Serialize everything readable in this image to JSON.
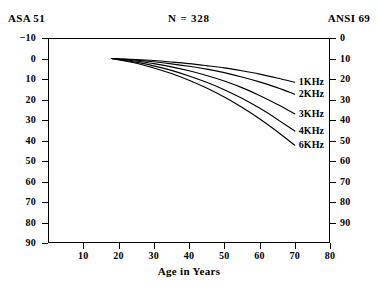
{
  "header": {
    "left_scale_label": "ASA 51",
    "right_scale_label": "ANSI 69",
    "sample_size": "N = 328"
  },
  "axes": {
    "x_title": "Age in Years",
    "x_ticks": [
      "10",
      "20",
      "30",
      "40",
      "50",
      "60",
      "70",
      "80"
    ],
    "y_left_ticks": [
      "-10",
      "0",
      "10",
      "20",
      "30",
      "40",
      "50",
      "60",
      "70",
      "80",
      "90"
    ],
    "y_right_ticks": [
      "0",
      "10",
      "20",
      "30",
      "40",
      "50",
      "60",
      "70",
      "80",
      "90"
    ]
  },
  "series_labels": {
    "s1": "1KHz",
    "s2": "2KHz",
    "s3": "3KHz",
    "s4": "4KHz",
    "s6": "6KHz"
  },
  "chart_data": {
    "type": "line",
    "title": "N = 328",
    "xlabel": "Age in Years",
    "ylabel": "Hearing Threshold Level (dB)",
    "y_left_axis_label": "ASA 51",
    "y_right_axis_label": "ANSI 69",
    "xlim": [
      0,
      80
    ],
    "ylim": [
      -10,
      90
    ],
    "y_inverted": true,
    "y_right_lim": [
      0,
      90
    ],
    "y_right_offset_db": 10,
    "grid": false,
    "legend": "inline-right-end-labels",
    "x": [
      18,
      25,
      30,
      35,
      40,
      45,
      50,
      55,
      60,
      65,
      70
    ],
    "series": [
      {
        "name": "1KHz",
        "values": [
          0,
          0.5,
          1.0,
          1.7,
          2.5,
          3.5,
          4.6,
          6.0,
          7.6,
          9.5,
          11.6
        ]
      },
      {
        "name": "2KHz",
        "values": [
          0,
          0.8,
          1.6,
          2.6,
          3.8,
          5.2,
          6.9,
          9.0,
          11.4,
          14.2,
          17.4
        ]
      },
      {
        "name": "3KHz",
        "values": [
          0,
          1.2,
          2.5,
          4.1,
          6.0,
          8.3,
          11.0,
          14.2,
          18.0,
          22.3,
          27.0
        ]
      },
      {
        "name": "4KHz",
        "values": [
          0,
          1.8,
          3.6,
          5.8,
          8.5,
          11.6,
          15.2,
          19.4,
          24.2,
          29.6,
          35.4
        ]
      },
      {
        "name": "6KHz",
        "values": [
          0,
          2.3,
          4.6,
          7.3,
          10.6,
          14.4,
          18.8,
          23.8,
          29.4,
          35.6,
          42.3
        ]
      }
    ]
  }
}
